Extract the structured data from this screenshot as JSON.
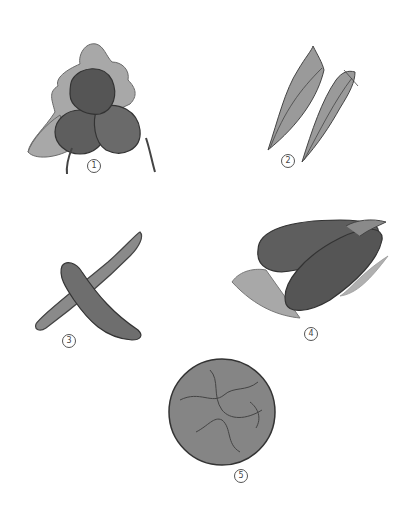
{
  "illustration": {
    "items": [
      {
        "id": 1,
        "label": "1",
        "subject": "radishes",
        "label_pos": [
          87,
          159
        ]
      },
      {
        "id": 2,
        "label": "2",
        "subject": "leafy greens",
        "label_pos": [
          281,
          154
        ]
      },
      {
        "id": 3,
        "label": "3",
        "subject": "cucumbers",
        "label_pos": [
          62,
          334
        ]
      },
      {
        "id": 4,
        "label": "4",
        "subject": "eggplants",
        "label_pos": [
          304,
          327
        ]
      },
      {
        "id": 5,
        "label": "5",
        "subject": "cabbage",
        "label_pos": [
          234,
          469
        ]
      }
    ],
    "colors": {
      "outline": "#3a3a3a",
      "dark_fill": "#5e5e5e",
      "mid_fill": "#8a8a8a",
      "leaf_fill": "#a8a8a8",
      "background": "#ffffff"
    }
  }
}
